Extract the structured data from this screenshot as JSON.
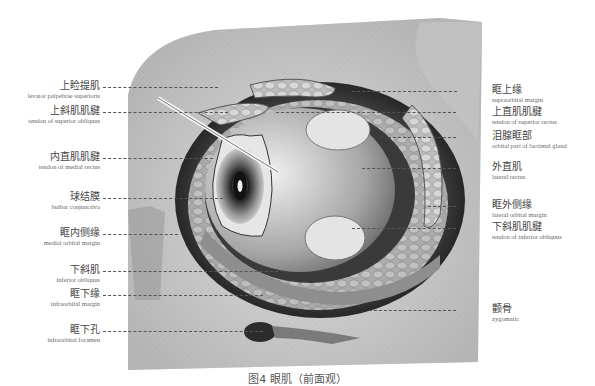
{
  "figure": {
    "caption": "图4  眼肌（前面观）"
  },
  "labels_left": [
    {
      "zh": "上睑提肌",
      "en": "levator palpebrae superioris"
    },
    {
      "zh": "上斜肌肌腱",
      "en": "tendon of superior obliquus"
    },
    {
      "zh": "内直肌肌腱",
      "en": "tendon of medial rectus"
    },
    {
      "zh": "球结膜",
      "en": "bulbar conjunctiva"
    },
    {
      "zh": "眶内侧缘",
      "en": "medial orbital margin"
    },
    {
      "zh": "下斜肌",
      "en": "inferior obliquus"
    },
    {
      "zh": "眶下缘",
      "en": "infraorbital margin"
    },
    {
      "zh": "眶下孔",
      "en": "infraorbital foramen"
    }
  ],
  "labels_right": [
    {
      "zh": "眶上缘",
      "en": "supraorbital margin"
    },
    {
      "zh": "上直肌肌腱",
      "en": "tendon of superior rectus"
    },
    {
      "zh": "泪腺眶部",
      "en": "orbital part of lacrimal gland"
    },
    {
      "zh": "外直肌",
      "en": "lateral rectus"
    },
    {
      "zh": "眶外侧缘",
      "en": "lateral orbital margin"
    },
    {
      "zh": "下斜肌肌腱",
      "en": "tendon of inferior obliquus"
    },
    {
      "zh": "颧骨",
      "en": "zygomatic"
    }
  ]
}
